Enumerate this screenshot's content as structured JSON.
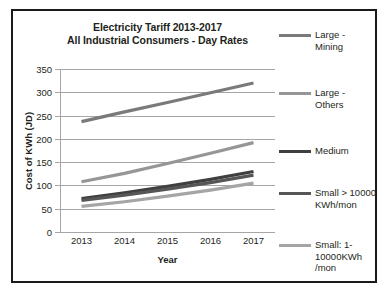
{
  "chart_data": {
    "type": "line",
    "title": "Electricity Tariff 2013-2017\nAll Industrial Consumers - Day Rates",
    "title_line1": "Electricity Tariff 2013-2017",
    "title_line2": "All Industrial Consumers - Day Rates",
    "xlabel": "Year",
    "ylabel": "Cost of KWh (JD)",
    "categories": [
      "2013",
      "2014",
      "2015",
      "2016",
      "2017"
    ],
    "ylim": [
      0,
      350
    ],
    "ytick_step": 50,
    "yticks": [
      "350",
      "300",
      "250",
      "200",
      "150",
      "100",
      "50",
      "0"
    ],
    "grid": true,
    "legend_position": "right",
    "series": [
      {
        "name": "Large -\nMining",
        "label_line1": "Large -",
        "label_line2": "Mining",
        "values": [
          237,
          258,
          278,
          299,
          320
        ],
        "color": "#7a7a7a"
      },
      {
        "name": "Large -\nOthers",
        "label_line1": "Large -",
        "label_line2": "Others",
        "values": [
          108,
          126,
          147,
          169,
          192
        ],
        "color": "#969696"
      },
      {
        "name": "Medium",
        "label_line1": "Medium",
        "label_line2": "",
        "values": [
          72,
          84,
          98,
          113,
          130
        ],
        "color": "#3f3f3f"
      },
      {
        "name": "Small > 10000 KWh/mon",
        "label_line1": "Small >",
        "label_line2": "10000\nKWh/mon",
        "values": [
          68,
          79,
          92,
          106,
          122
        ],
        "color": "#565656"
      },
      {
        "name": "Small: 1-10000KWh /mon",
        "label_line1": "Small: 1-",
        "label_line2": "10000KWh\n/mon",
        "values": [
          55,
          65,
          77,
          90,
          105
        ],
        "color": "#a5a5a5"
      }
    ]
  },
  "figure": {
    "border_color": "#1a1a1a",
    "grid_color": "#a6a6a6",
    "background": "#ffffff"
  }
}
